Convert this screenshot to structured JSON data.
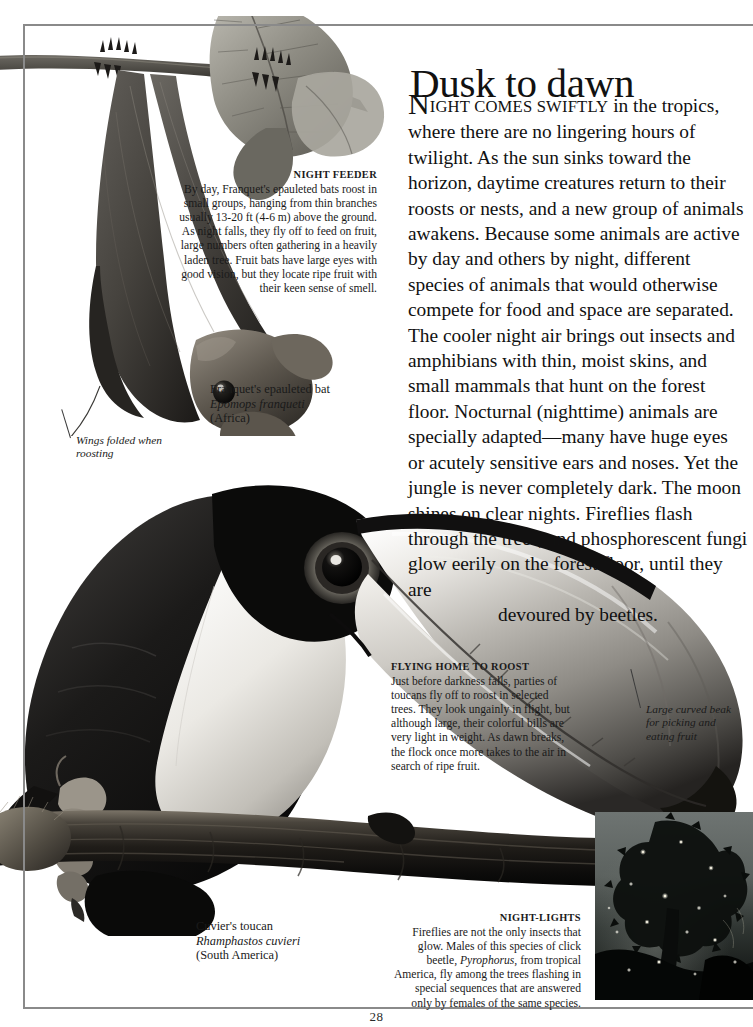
{
  "page": {
    "number": "28",
    "headline": "Dusk to dawn"
  },
  "intro": {
    "dropcap": "N",
    "smallcaps": "IGHT COMES SWIFTLY",
    "body": " in the tropics, where there are no lingering hours of twilight. As the sun sinks toward the horizon, daytime creatures return to their roosts or nests, and a new group of animals awakens. Because some animals are active by day and others by night, different species of animals that would otherwise compete for food and space are separated. The cooler night air brings out insects and amphibians with thin, moist skins, and small mammals that hunt on the forest floor. Nocturnal (nighttime) animals are specially adapted—many have huge eyes or acutely sensitive ears and noses. Yet the jungle is never completely dark. The moon shines on clear nights. Fireflies flash through the trees, and phosphorescent fungi glow eerily on the forest floor, until they are",
    "last_line": "devoured by beetles."
  },
  "captions": {
    "night_feeder": {
      "heading": "NIGHT FEEDER",
      "body": "By day, Franquet's epauleted bats roost in small groups, hanging from thin branches usually 13-20 ft (4-6 m) above the ground. As night falls, they fly off to feed on fruit, large numbers often gathering in a heavily laden tree. Fruit bats have large eyes with good vision, but they locate ripe fruit with their keen sense of smell."
    },
    "flying_home": {
      "heading": "FLYING HOME TO ROOST",
      "body": "Just before darkness falls, parties of toucans fly off to roost in selected trees. They look ungainly in flight, but although large, their colorful bills are very light in weight. As dawn breaks, the flock once more takes to the air in search of ripe fruit."
    },
    "night_lights": {
      "heading": "NIGHT-LIGHTS",
      "body_pre": "Fireflies are not the only insects that glow. Males of this species of click beetle, ",
      "body_italic": "Pyrophorus",
      "body_post": ", from tropical America, fly among the trees flashing in special sequences that are answered only by females of the same species."
    }
  },
  "species": {
    "bat": {
      "common": "Franquet's epauleted bat",
      "scientific": "Epomops franqueti",
      "region": "(Africa)"
    },
    "toucan": {
      "common": "Cuvier's toucan",
      "scientific": "Rhamphastos cuvieri",
      "region": "(South America)"
    }
  },
  "annotations": {
    "wings": "Wings folded when roosting",
    "beak": "Large curved beak for picking and eating fruit"
  },
  "colors": {
    "rule": "#8a8a8a",
    "text": "#1a1a1a",
    "night_sky": "#6e7472"
  }
}
